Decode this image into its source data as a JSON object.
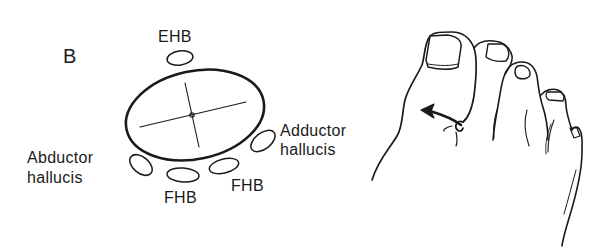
{
  "panel_label": "B",
  "cross_section": {
    "description": "Cross-section of first metatarsal with surrounding tendons",
    "tendons": [
      {
        "id": "ehb",
        "label": "EHB"
      },
      {
        "id": "adductor",
        "label_line1": "Adductor",
        "label_line2": "hallucis"
      },
      {
        "id": "abductor",
        "label_line1": "Abductor",
        "label_line2": "hallucis"
      },
      {
        "id": "fhb_medial",
        "label": "FHB"
      },
      {
        "id": "fhb_lateral",
        "label": "FHB"
      }
    ]
  },
  "foot_illustration": {
    "description": "Dorsal view of forefoot with arrow indicating rotation of the great toe",
    "arrow": "rotation-arrow"
  },
  "colors": {
    "ink": "#1a1a1a",
    "background": "#ffffff"
  }
}
